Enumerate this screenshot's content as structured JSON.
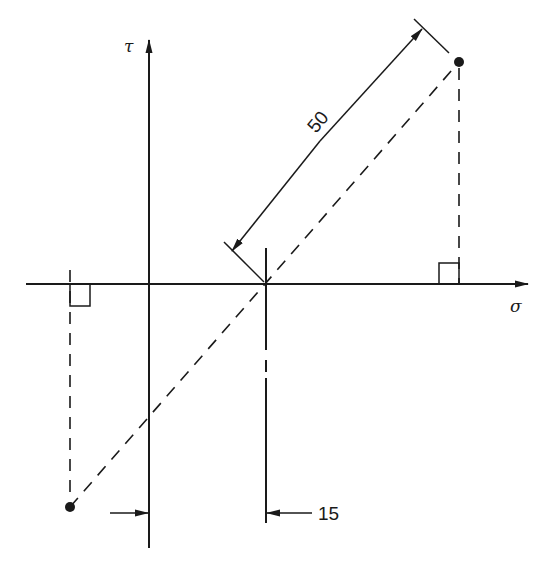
{
  "diagram": {
    "type": "Mohr circle construction (stress space)",
    "axes": {
      "horizontal_label": "σ",
      "vertical_label": "τ"
    },
    "dimensions": {
      "radius_label": "50",
      "offset_label": "15"
    },
    "points": [
      {
        "name": "upper-right-stress-point",
        "description": "dot at top right"
      },
      {
        "name": "lower-left-stress-point",
        "description": "dot at bottom left"
      }
    ],
    "colors": {
      "ink": "#1a1a1a",
      "background": "#ffffff"
    }
  }
}
